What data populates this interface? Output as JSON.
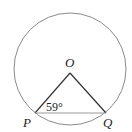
{
  "diagram": {
    "type": "circle-geometry",
    "circle": {
      "cx": 70,
      "cy": 69,
      "r": 56,
      "stroke": "#8a8a8a"
    },
    "points": {
      "O": {
        "label": "O",
        "x": 70,
        "y": 73
      },
      "P": {
        "label": "P",
        "x": 35,
        "y": 113
      },
      "Q": {
        "label": "Q",
        "x": 106,
        "y": 113
      }
    },
    "angle_label": "59°",
    "segments": [
      "OP",
      "OQ",
      "PQ"
    ]
  }
}
